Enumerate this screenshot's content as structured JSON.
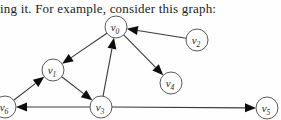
{
  "caption": {
    "text": "ing it. For example, consider this graph:"
  },
  "graph": {
    "canvas": {
      "width": 281,
      "height": 120
    },
    "node_radius": 11,
    "node_fill": "#fefefe",
    "node_stroke": "#5a5a5a",
    "edge_color": "#3a3a3a",
    "arrow_color": "#0d0d0d",
    "label_color": "#2b2b2b",
    "arrow_length": 11,
    "arrow_half_width": 4.5,
    "nodes": [
      {
        "id": "v0",
        "label": "v",
        "sub": "0",
        "x": 116,
        "y": 27
      },
      {
        "id": "v1",
        "label": "v",
        "sub": "1",
        "x": 53,
        "y": 70
      },
      {
        "id": "v2",
        "label": "v",
        "sub": "2",
        "x": 197,
        "y": 40
      },
      {
        "id": "v3",
        "label": "v",
        "sub": "3",
        "x": 101,
        "y": 107
      },
      {
        "id": "v4",
        "label": "v",
        "sub": "4",
        "x": 171,
        "y": 83
      },
      {
        "id": "v5",
        "label": "v",
        "sub": "5",
        "x": 267,
        "y": 108
      },
      {
        "id": "v6",
        "label": "v",
        "sub": "6",
        "x": 5,
        "y": 107
      }
    ],
    "edges": [
      {
        "from": "v0",
        "to": "v1"
      },
      {
        "from": "v2",
        "to": "v0"
      },
      {
        "from": "v0",
        "to": "v4"
      },
      {
        "from": "v3",
        "to": "v0"
      },
      {
        "from": "v6",
        "to": "v1"
      },
      {
        "from": "v1",
        "to": "v3"
      },
      {
        "from": "v3",
        "to": "v6"
      },
      {
        "from": "v3",
        "to": "v5"
      }
    ]
  }
}
